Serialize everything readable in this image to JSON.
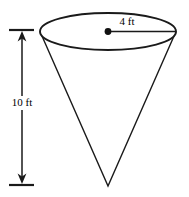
{
  "figure": {
    "name": "cone-geometry-diagram",
    "shape": "cone",
    "orientation": "apex-down",
    "background_color": "#ffffff",
    "stroke_color": "#000000",
    "fill_color": "#ffffff",
    "labels": {
      "height": "10 ft",
      "radius": "4 ft"
    },
    "dimensions": {
      "height_value": 10,
      "height_unit": "ft",
      "radius_value": 4,
      "radius_unit": "ft"
    },
    "geometry": {
      "ellipse_center_x": 108,
      "ellipse_center_y": 31.5,
      "ellipse_rx": 68,
      "ellipse_ry": 18.5,
      "apex_x": 108,
      "apex_y": 186,
      "radius_line_start_x": 108,
      "radius_line_start_y": 31.5,
      "radius_line_end_x": 176,
      "radius_line_end_y": 31.5,
      "center_dot_radius": 3.2,
      "dim_line_x": 22,
      "dim_line_top_y": 30,
      "dim_line_bottom_y": 185,
      "tick_left_x": 9,
      "tick_right_x": 34
    }
  }
}
